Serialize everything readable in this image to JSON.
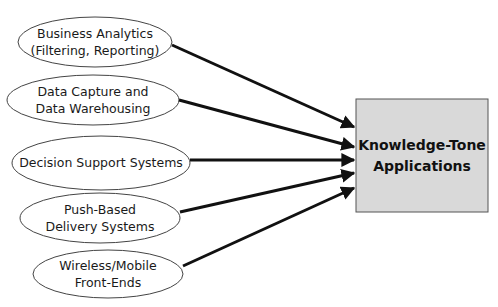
{
  "diagram": {
    "sources": [
      {
        "id": "business-analytics",
        "line1": "Business Analytics",
        "line2": "(Filtering, Reporting)"
      },
      {
        "id": "data-capture",
        "line1": "Data Capture and",
        "line2": "Data Warehousing"
      },
      {
        "id": "decision-support",
        "line1": "Decision Support Systems",
        "line2": ""
      },
      {
        "id": "push-based",
        "line1": "Push-Based",
        "line2": "Delivery Systems"
      },
      {
        "id": "wireless-mobile",
        "line1": "Wireless/Mobile",
        "line2": "Front-Ends"
      }
    ],
    "target": {
      "line1": "Knowledge-Tone",
      "line2": "Applications"
    },
    "colors": {
      "box_fill": "#d9d9d9",
      "box_border": "#555555",
      "arrow": "#111111",
      "ellipse_stroke": "#444444"
    }
  }
}
